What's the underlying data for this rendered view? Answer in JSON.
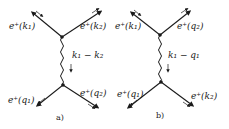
{
  "figure": {
    "panels": [
      {
        "id": "a",
        "caption": "a)",
        "top_left_label": "e⁺(k₁)",
        "top_right_label": "e⁺(k₂)",
        "bottom_left_label": "e⁺(q₁)",
        "bottom_right_label": "e⁺(q₂)",
        "propagator_label": "k₁ − k₂"
      },
      {
        "id": "b",
        "caption": "b)",
        "top_left_label": "e⁺(k₁)",
        "top_right_label": "e⁺(q₂)",
        "bottom_left_label": "e⁺(q₁)",
        "bottom_right_label": "e⁺(k₂)",
        "propagator_label": "k₁ − q₁"
      }
    ],
    "colors": {
      "ink": "#1a1a1a",
      "background": "#ffffff"
    }
  }
}
